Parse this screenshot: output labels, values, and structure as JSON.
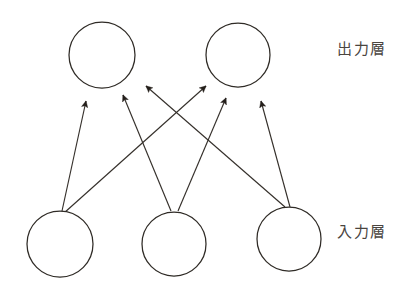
{
  "figure": {
    "background_color": "#ffffff",
    "stroke_color": "#35302b",
    "text_color": "#4a453f",
    "width": 415,
    "height": 290
  },
  "labels": {
    "output_layer": "出力層",
    "input_layer": "入力層"
  },
  "chart_data": {
    "type": "diagram",
    "title": "",
    "layout": "two-layer feedforward network, arrows point from input layer up to output layer",
    "layers": [
      {
        "name": "output_layer",
        "label": "出力層",
        "nodes": [
          {
            "id": "o1",
            "cx": 102,
            "cy": 55,
            "r": 33
          },
          {
            "id": "o2",
            "cx": 238,
            "cy": 55,
            "r": 32
          }
        ]
      },
      {
        "name": "input_layer",
        "label": "入力層",
        "nodes": [
          {
            "id": "i1",
            "cx": 60,
            "cy": 244,
            "r": 33
          },
          {
            "id": "i2",
            "cx": 174,
            "cy": 244,
            "r": 32
          },
          {
            "id": "i3",
            "cx": 289,
            "cy": 239,
            "r": 32
          }
        ]
      }
    ],
    "edges": [
      {
        "from": "i1",
        "to": "o1",
        "x1": 62,
        "y1": 211,
        "x2": 86,
        "y2": 101
      },
      {
        "from": "i1",
        "to": "o2",
        "x1": 64,
        "y1": 213,
        "x2": 206,
        "y2": 86
      },
      {
        "from": "i2",
        "to": "o1",
        "x1": 171,
        "y1": 211,
        "x2": 123,
        "y2": 95
      },
      {
        "from": "i2",
        "to": "o2",
        "x1": 178,
        "y1": 211,
        "x2": 226,
        "y2": 98
      },
      {
        "from": "i3",
        "to": "o1",
        "x1": 285,
        "y1": 207,
        "x2": 146,
        "y2": 86
      },
      {
        "from": "i3",
        "to": "o2",
        "x1": 290,
        "y1": 207,
        "x2": 261,
        "y2": 101
      }
    ],
    "edge_count": 6,
    "arrow_direction": "input to output"
  }
}
